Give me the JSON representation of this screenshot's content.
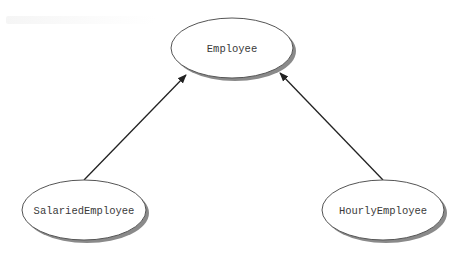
{
  "diagram": {
    "type": "class-inheritance",
    "colors": {
      "background": "#ffffff",
      "node_fill": "#ffffff",
      "node_stroke": "#555555",
      "node_shadow": "#8a8a8a",
      "edge": "#222222",
      "label": "#3a3a3a"
    },
    "nodes": [
      {
        "id": "employee",
        "label": "Employee",
        "cx": 232,
        "cy": 48,
        "rx": 61,
        "ry": 30
      },
      {
        "id": "salaried",
        "label": "SalariedEmployee",
        "cx": 84,
        "cy": 210,
        "rx": 62,
        "ry": 30
      },
      {
        "id": "hourly",
        "label": "HourlyEmployee",
        "cx": 383,
        "cy": 210,
        "rx": 61,
        "ry": 30
      }
    ],
    "edges": [
      {
        "from": "salaried",
        "to": "employee",
        "arrow": "end",
        "x1": 84,
        "y1": 180,
        "x2": 186,
        "y2": 75
      },
      {
        "from": "hourly",
        "to": "employee",
        "arrow": "end",
        "x1": 383,
        "y1": 180,
        "x2": 280,
        "y2": 73
      }
    ]
  }
}
